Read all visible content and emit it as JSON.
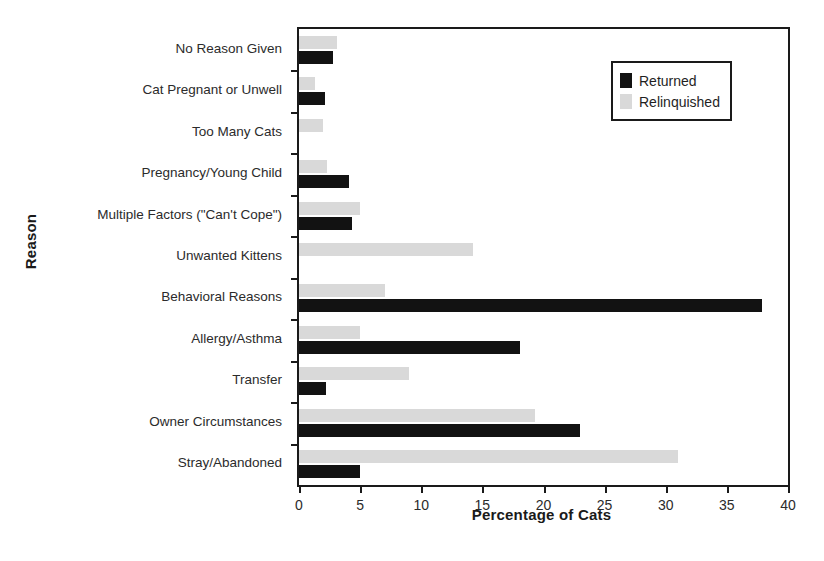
{
  "chart_data": {
    "type": "bar",
    "orientation": "horizontal",
    "title": "",
    "xlabel": "Percentage of Cats",
    "ylabel": "Reason",
    "xlim": [
      0,
      40
    ],
    "xticks": [
      0,
      5,
      10,
      15,
      20,
      25,
      30,
      35,
      40
    ],
    "grid": false,
    "legend_position": "top-right",
    "categories": [
      "No Reason Given",
      "Cat Pregnant or Unwell",
      "Too Many Cats",
      "Pregnancy/Young Child",
      "Multiple Factors (\"Can't Cope\")",
      "Unwanted Kittens",
      "Behavioral Reasons",
      "Allergy/Asthma",
      "Transfer",
      "Owner Circumstances",
      "Stray/Abandoned"
    ],
    "series": [
      {
        "name": "Returned",
        "color": "#121212",
        "values": [
          2.8,
          2.1,
          0,
          4.1,
          4.3,
          0,
          37.9,
          18.1,
          2.2,
          23.0,
          5.0
        ]
      },
      {
        "name": "Relinquished",
        "color": "#d9d9d9",
        "values": [
          3.1,
          1.3,
          2.0,
          2.3,
          5.0,
          14.2,
          7.0,
          5.0,
          9.0,
          19.3,
          31.0
        ]
      }
    ]
  },
  "legend": {
    "entries": [
      {
        "label": "Returned",
        "swatch": "returned"
      },
      {
        "label": "Relinquished",
        "swatch": "relinq"
      }
    ]
  }
}
